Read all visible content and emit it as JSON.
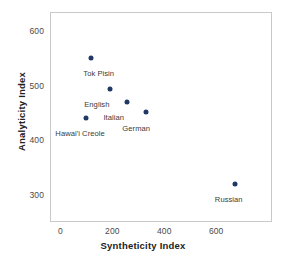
{
  "chart_data": {
    "type": "scatter",
    "title": "",
    "xlabel": "Syntheticity Index",
    "ylabel": "Analyticity Index",
    "xlim": [
      -40,
      815
    ],
    "ylim": [
      250,
      635
    ],
    "xticks": [
      0,
      200,
      400,
      600
    ],
    "yticks": [
      300,
      400,
      500,
      600
    ],
    "xticklabels": [
      "0",
      "200",
      "400",
      "600"
    ],
    "yticklabels": [
      "300",
      "400",
      "500",
      "600"
    ],
    "grid": false,
    "legend": "none",
    "point_color": "#1f3864",
    "frame_color": "#c9c9c9",
    "points": [
      {
        "label": "Tok Pisin",
        "x": 119,
        "y": 551,
        "label_dx": -8,
        "label_dy": 11
      },
      {
        "label": "English",
        "x": 192,
        "y": 493,
        "label_dx": -26,
        "label_dy": 11
      },
      {
        "label": "Italian",
        "x": 258,
        "y": 470,
        "label_dx": -24,
        "label_dy": 11
      },
      {
        "label": "German",
        "x": 331,
        "y": 452,
        "label_dx": -24,
        "label_dy": 12
      },
      {
        "label": "Hawai'i Creole",
        "x": 100,
        "y": 440,
        "label_dx": -31,
        "label_dy": 11
      },
      {
        "label": "Russian",
        "x": 672,
        "y": 319,
        "label_dx": -20,
        "label_dy": 11
      }
    ]
  }
}
